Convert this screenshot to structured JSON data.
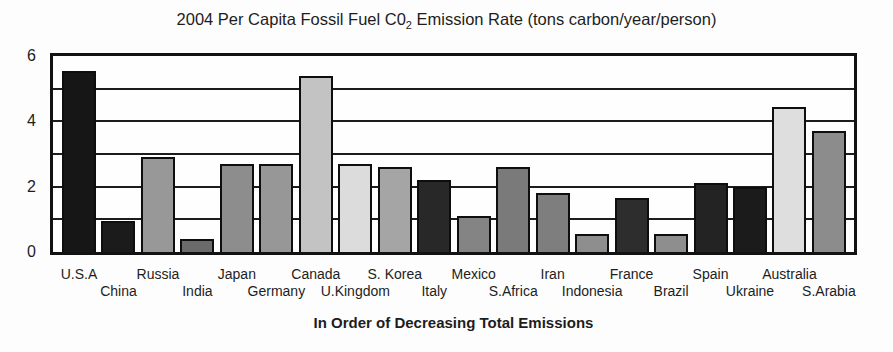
{
  "chart_data": {
    "type": "bar",
    "title": {
      "prefix": "2004 Per Capita Fossil Fuel C0",
      "subscript": "2",
      "suffix": " Emission Rate (tons carbon/year/person)"
    },
    "xlabel": "In Order of Decreasing Total Emissions",
    "ylabel": "",
    "ylim": [
      0,
      6
    ],
    "ytick_labels": [
      6,
      4,
      2,
      0
    ],
    "gridlines": [
      1,
      2,
      3,
      4,
      5
    ],
    "grid_on": true,
    "legend": "none",
    "categories": [
      "U.S.A",
      "China",
      "Russia",
      "India",
      "Japan",
      "Germany",
      "Canada",
      "U.Kingdom",
      "S. Korea",
      "Italy",
      "Mexico",
      "S.Africa",
      "Iran",
      "Indonesia",
      "France",
      "Brazil",
      "Spain",
      "Ukraine",
      "Australia",
      "S.Arabia"
    ],
    "values": [
      5.55,
      0.95,
      2.9,
      0.4,
      2.7,
      2.7,
      5.4,
      2.7,
      2.6,
      2.2,
      1.1,
      2.6,
      1.8,
      0.55,
      1.65,
      0.55,
      2.1,
      2.0,
      4.45,
      3.7
    ],
    "bar_colors": [
      "#161616",
      "#1b1b1b",
      "#989898",
      "#6b6b6b",
      "#8d8d8d",
      "#979797",
      "#c3c3c3",
      "#dcdcdc",
      "#a5a5a5",
      "#282828",
      "#848484",
      "#7a7a7a",
      "#7e7e7e",
      "#8e8e8e",
      "#2d2d2d",
      "#8e8e8e",
      "#232323",
      "#1b1b1b",
      "#dedede",
      "#8c8c8c"
    ]
  },
  "colors": {
    "frame": "#121212",
    "grid": "#1c1c1c",
    "bar_border": "#0e0e0e",
    "background": "#fdfdfd",
    "text": "#1d1d1d"
  }
}
